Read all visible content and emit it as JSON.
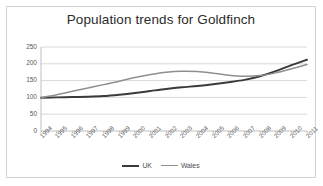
{
  "chart_data": {
    "type": "line",
    "title": "Population trends for Goldfinch",
    "xlabel": "",
    "ylabel": "",
    "ylim": [
      0,
      250
    ],
    "yticks": [
      0,
      50,
      100,
      150,
      200,
      250
    ],
    "grid": true,
    "legend_position": "bottom",
    "categories": [
      "1994",
      "1995",
      "1996",
      "1997",
      "1998",
      "1999",
      "2000",
      "2001",
      "2002",
      "2003",
      "2004",
      "2005",
      "2006",
      "2007",
      "2008",
      "2009",
      "2010",
      "2011"
    ],
    "series": [
      {
        "name": "UK",
        "color": "#3a3a3a",
        "values": [
          99,
          100,
          101,
          102,
          104,
          108,
          113,
          119,
          125,
          130,
          134,
          139,
          145,
          152,
          163,
          178,
          196,
          212
        ]
      },
      {
        "name": "Wales",
        "color": "#8f8f8f",
        "values": [
          99,
          108,
          118,
          128,
          138,
          148,
          159,
          168,
          175,
          178,
          177,
          172,
          166,
          163,
          165,
          173,
          185,
          198
        ]
      }
    ]
  },
  "legend": {
    "items": [
      {
        "label": "UK"
      },
      {
        "label": "Wales"
      }
    ]
  },
  "colors": {
    "uk_line": "#3a3a3a",
    "wales_line": "#8f8f8f",
    "grid": "#d9d9d9",
    "axis": "#bfbfbf",
    "tick_text": "#595959",
    "title_text": "#2b2b2b",
    "card_border": "#d2d2d2",
    "background": "#ffffff"
  }
}
